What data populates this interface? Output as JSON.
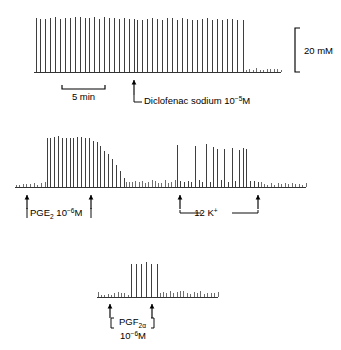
{
  "figure": {
    "title": "",
    "background": "#ffffff",
    "trace_color": "#1d1d1d"
  },
  "scale_bars": {
    "vertical": {
      "label": "20 mM",
      "value": 20,
      "unit": "mM",
      "x": 295,
      "y_top": 28,
      "y_bottom": 72,
      "cap_width": 5
    },
    "horizontal": {
      "label": "5 min",
      "value": 5,
      "unit": "min",
      "x_left": 62,
      "x_right": 105,
      "y": 89,
      "cap_height": 4
    }
  },
  "panels": [
    {
      "id": "panel-diclofenac",
      "baseline_y": 72,
      "x_start": 34,
      "x_end": 281,
      "markers": [
        {
          "name": "diclofenac-marker",
          "type": "single-arrow",
          "x": 134,
          "arrow_top": 80,
          "arrow_bottom": 95,
          "leader_drop": 102,
          "leader_right": 142,
          "label_x": 144,
          "label_y": 104,
          "label_main": "Diclofenac sodium 10",
          "label_sup": "−5",
          "label_tail": "M"
        }
      ],
      "segments": [
        {
          "name": "pre-drug-contractions",
          "x_from": 36,
          "x_to": 134,
          "count": 21,
          "amplitude_top": 17,
          "kind": "tall"
        },
        {
          "name": "post-drug-contractions",
          "x_from": 137,
          "x_to": 243,
          "count": 22,
          "amplitude_top": 18,
          "kind": "tall"
        },
        {
          "name": "quiescent-baseline",
          "x_from": 246,
          "x_to": 281,
          "count": 11,
          "amplitude_top": 68,
          "kind": "short"
        }
      ]
    },
    {
      "id": "panel-pge2-k",
      "baseline_y": 187,
      "x_start": 15,
      "x_end": 306,
      "markers": [
        {
          "name": "pge2-start-marker",
          "type": "arrow-up",
          "x": 27,
          "arrow_top": 195,
          "arrow_bottom": 209
        },
        {
          "name": "pge2-end-marker",
          "type": "arrow-up",
          "x": 91,
          "arrow_top": 195,
          "arrow_bottom": 209
        },
        {
          "name": "k-start-marker",
          "type": "arrow-up",
          "x": 180,
          "arrow_top": 195,
          "arrow_bottom": 209
        },
        {
          "name": "k-end-marker",
          "type": "arrow-up",
          "x": 258,
          "arrow_top": 195,
          "arrow_bottom": 209
        }
      ],
      "labels": [
        {
          "name": "pge2-label",
          "main": "PGE",
          "sub": "2",
          "mid": " 10",
          "sup": "−6",
          "tail": "M",
          "x": 30,
          "y": 216,
          "bracket_left_x": 27,
          "bracket_right_x": 91,
          "bracket_y": 212,
          "bracket_drop": 6
        },
        {
          "name": "potassium-label",
          "main": "12 K",
          "sup": "+",
          "x": 206,
          "y": 216,
          "connector_y": 213,
          "connector_left": 180,
          "connector_right": 258,
          "gap_left": 201,
          "gap_right": 232
        }
      ],
      "segments": [
        {
          "name": "pre-pge2-baseline",
          "x_from": 16,
          "x_to": 45,
          "count": 9,
          "amplitude_top": 182,
          "kind": "short"
        },
        {
          "name": "pge2-response-burst",
          "x_from": 47,
          "x_to": 124,
          "count": 21,
          "amplitude_top": 136,
          "kind": "tall-decaying"
        },
        {
          "name": "post-pge2-washout",
          "x_from": 126,
          "x_to": 175,
          "count": 16,
          "amplitude_top": 180,
          "kind": "short"
        },
        {
          "name": "k-response-burst",
          "x_from": 177,
          "x_to": 258,
          "count": 23,
          "amplitude_top": 145,
          "kind": "irregular"
        },
        {
          "name": "post-k-baseline",
          "x_from": 261,
          "x_to": 306,
          "count": 14,
          "amplitude_top": 182,
          "kind": "short"
        }
      ]
    },
    {
      "id": "panel-pgf2a",
      "baseline_y": 297,
      "x_start": 97,
      "x_end": 218,
      "markers": [
        {
          "name": "pgf2a-start-marker",
          "type": "arrow-up",
          "x": 110,
          "arrow_top": 304,
          "arrow_bottom": 318
        },
        {
          "name": "pgf2a-end-marker",
          "type": "arrow-up",
          "x": 152,
          "arrow_top": 304,
          "arrow_bottom": 318
        }
      ],
      "labels": [
        {
          "name": "pgf2a-label",
          "main": "PGF",
          "sub": "2α",
          "x": 119,
          "y": 325,
          "bracket_left_x": 111,
          "bracket_right_x": 154,
          "bracket_y": 318,
          "bracket_height": 10
        },
        {
          "name": "pgf2a-concentration-label",
          "main": "10",
          "sup": "−6",
          "tail": "M",
          "x": 120,
          "y": 339
        }
      ],
      "segments": [
        {
          "name": "pre-pgf2a-baseline",
          "x_from": 98,
          "x_to": 128,
          "count": 10,
          "amplitude_top": 292,
          "kind": "short"
        },
        {
          "name": "pgf2a-response-burst",
          "x_from": 131,
          "x_to": 157,
          "count": 6,
          "amplitude_top": 262,
          "kind": "tall"
        },
        {
          "name": "post-pgf2a-baseline",
          "x_from": 160,
          "x_to": 218,
          "count": 18,
          "amplitude_top": 291,
          "kind": "short"
        }
      ]
    }
  ],
  "chart_data": {
    "type": "line",
    "title": "",
    "subtitle": "",
    "xlabel": "Time",
    "ylabel": "Tension",
    "axis_units": {
      "x": "min",
      "y": "mM"
    },
    "grid": false,
    "legend_position": "none",
    "calibration": {
      "vertical": "20 mM",
      "horizontal": "5 min"
    },
    "series": [
      {
        "name": "Trace 1 — Diclofenac sodium",
        "drug": "Diclofenac sodium",
        "concentration": "10−5M",
        "annotation": "Diclofenac sodium 10−5M",
        "phases": [
          {
            "label": "Spontaneous contractions before drug",
            "spike_count": 21,
            "relative_amplitude": 1.0
          },
          {
            "label": "Contractions continuing after drug",
            "spike_count": 22,
            "relative_amplitude": 1.0
          },
          {
            "label": "Abolished activity",
            "spike_count": 11,
            "relative_amplitude": 0.07
          }
        ]
      },
      {
        "name": "Trace 2 — PGE2 and 12 K+",
        "drugs": [
          "PGE2 10−6M",
          "12 K+"
        ],
        "annotations": [
          "PGE₂ 10−6M",
          "12 K⁺"
        ],
        "phases": [
          {
            "label": "Quiescent baseline",
            "spike_count": 9,
            "relative_amplitude": 0.09
          },
          {
            "label": "PGE2-evoked contractions",
            "spike_count": 21,
            "relative_amplitude": 0.93
          },
          {
            "label": "Washout",
            "spike_count": 16,
            "relative_amplitude": 0.12
          },
          {
            "label": "12 K+ evoked contractions",
            "spike_count": 23,
            "relative_amplitude": 0.76
          },
          {
            "label": "Return to baseline",
            "spike_count": 14,
            "relative_amplitude": 0.09
          }
        ]
      },
      {
        "name": "Trace 3 — PGF2α",
        "drug": "PGF2α",
        "concentration": "10−6M",
        "annotation": "PGF₂α 10−6M",
        "phases": [
          {
            "label": "Quiescent baseline",
            "spike_count": 10,
            "relative_amplitude": 0.09
          },
          {
            "label": "PGF2α-evoked contractions",
            "spike_count": 6,
            "relative_amplitude": 0.64
          },
          {
            "label": "Return to baseline",
            "spike_count": 18,
            "relative_amplitude": 0.11
          }
        ]
      }
    ]
  }
}
